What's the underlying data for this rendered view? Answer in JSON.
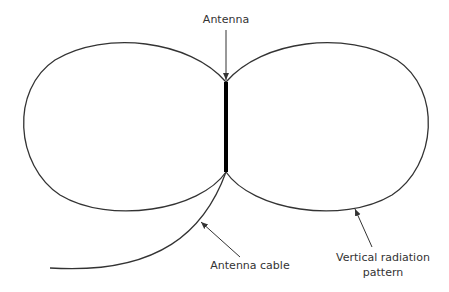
{
  "diagram": {
    "labels": {
      "antenna": "Antenna",
      "cable": "Antenna cable",
      "pattern_line1": "Vertical radiation",
      "pattern_line2": "pattern"
    },
    "colors": {
      "stroke": "#333333",
      "antenna": "#000000",
      "background": "#ffffff"
    }
  }
}
